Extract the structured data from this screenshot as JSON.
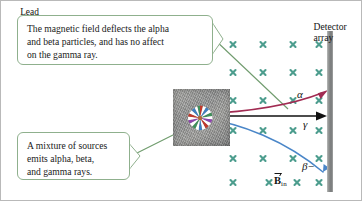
{
  "figure": {
    "background_color": "#ffffff",
    "border_color": "#b9b9b9"
  },
  "callouts": [
    {
      "id": "top",
      "lines": [
        "The magnetic field deflects the alpha",
        "and beta particles, and has no affect",
        "on the gamma ray."
      ],
      "border_color": "#8fb08d",
      "leader_color": "#6f9b6d",
      "tail_side": "right"
    },
    {
      "id": "bottom",
      "lines": [
        "A mixture of sources",
        "emits alpha, beta,",
        "and gamma rays."
      ],
      "border_color": "#8fb08d",
      "leader_color": "#6f9b6d",
      "tail_side": "right"
    }
  ],
  "lead_block": {
    "label": "Lead",
    "fill_color": "#8f9090"
  },
  "source": {
    "name": "radioactive-source-starburst",
    "spoke_colors": [
      "#c0392b",
      "#ffffff",
      "#3f7fbf",
      "#ffffff",
      "#3f8f5a",
      "#ffffff",
      "#8e44ad",
      "#ffffff"
    ],
    "center_color": "#b06a3a"
  },
  "detector": {
    "label_lines": [
      "Detector",
      "array"
    ],
    "bar_color": "#8e908f"
  },
  "field": {
    "symbol": "×",
    "label_vector": "B",
    "label_subscript": "in",
    "color": "#4d9d8e",
    "columns": 4,
    "rows": 5,
    "description": "Magnetic field directed into the page"
  },
  "tracks": [
    {
      "id": "alpha",
      "label": "α",
      "color": "#a12b52",
      "deflection": "upward",
      "description": "Alpha particle curves up toward the detector array"
    },
    {
      "id": "gamma",
      "label": "γ",
      "color": "#111111",
      "deflection": "none",
      "description": "Gamma ray travels straight, undeflected"
    },
    {
      "id": "beta",
      "label": "β−",
      "color": "#4a86c8",
      "deflection": "downward",
      "description": "Beta minus particle curves down toward the detector array"
    }
  ]
}
